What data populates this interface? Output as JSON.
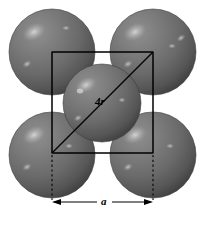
{
  "figure": {
    "background_color": "#ffffff",
    "width": 208,
    "height": 225
  },
  "annotations": {
    "diagonal_label": "4r",
    "edge_label": "a"
  },
  "geometry": {
    "cell_square": {
      "x": 52,
      "y": 52,
      "size": 101,
      "stroke": "#000000",
      "stroke_width": 1
    },
    "diagonal": {
      "x1": 153,
      "y1": 52,
      "x2": 52,
      "y2": 153,
      "stroke": "#000000",
      "stroke_width": 1.2
    },
    "dimension_line": {
      "y": 202,
      "x1": 52,
      "x2": 153,
      "stroke": "#000000"
    },
    "extension_lines": [
      {
        "x": 52,
        "y1": 155,
        "y2": 202
      },
      {
        "x": 153,
        "y1": 155,
        "y2": 202
      }
    ]
  },
  "spheres": [
    {
      "name": "corner-sphere-top-left",
      "cx": 52,
      "cy": 52,
      "r": 43
    },
    {
      "name": "corner-sphere-top-right",
      "cx": 153,
      "cy": 52,
      "r": 43
    },
    {
      "name": "corner-sphere-bottom-left",
      "cx": 52,
      "cy": 155,
      "r": 43
    },
    {
      "name": "corner-sphere-bottom-right",
      "cx": 153,
      "cy": 155,
      "r": 43
    },
    {
      "name": "center-sphere",
      "cx": 102,
      "cy": 103,
      "r": 39
    }
  ],
  "colors": {
    "sphere_light": "#8a8a8a",
    "sphere_mid": "#6f6f6f",
    "sphere_dark": "#4a4a4a",
    "sphere_edge": "#3a3a3a",
    "highlight": "#c8c8c8",
    "line": "#000000",
    "background": "#ffffff"
  }
}
